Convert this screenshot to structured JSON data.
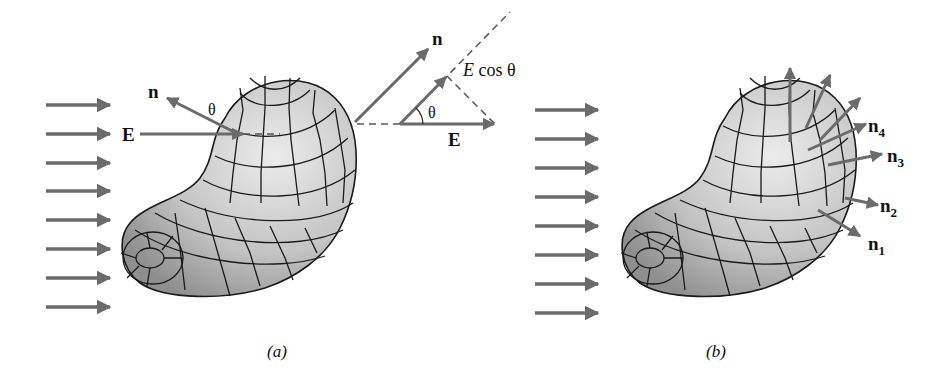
{
  "figure": {
    "panel_a": {
      "caption": "(a)",
      "labels": {
        "normal": "n",
        "field": "E",
        "angle": "θ",
        "inset_normal": "n",
        "inset_field": "E",
        "inset_angle": "θ",
        "component_E": "E",
        "component_cos": " cos θ"
      },
      "field_arrow_count": 8
    },
    "panel_b": {
      "caption": "(b)",
      "labels": {
        "n1": "n",
        "n1_sub": "1",
        "n2": "n",
        "n2_sub": "2",
        "n3": "n",
        "n3_sub": "3",
        "n4": "n",
        "n4_sub": "4"
      },
      "field_arrow_count": 8
    },
    "colors": {
      "arrow": "#6b6b6b",
      "surface_light": "#e4e4e4",
      "surface_dark": "#9a9a9a",
      "outline": "#1a1a1a",
      "text": "#111111"
    }
  }
}
